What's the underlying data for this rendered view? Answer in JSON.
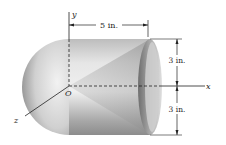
{
  "figure": {
    "axes": {
      "x_label": "x",
      "y_label": "y",
      "z_label": "z",
      "origin_label": "O"
    },
    "dimensions": {
      "length_label": "5 in.",
      "upper_radius_label": "3 in.",
      "lower_radius_label": "3 in."
    },
    "colors": {
      "line": "#222222",
      "body_light": "#f2f2f2",
      "body_dark": "#8a8a8a"
    }
  }
}
